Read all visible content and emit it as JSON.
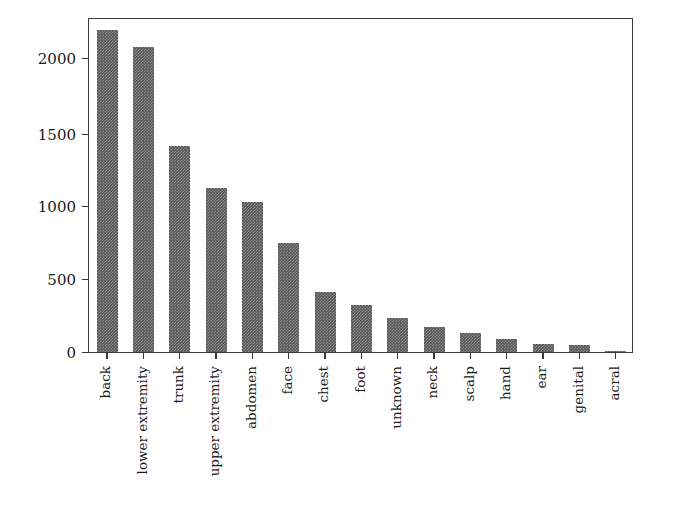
{
  "chart_data": {
    "type": "bar",
    "title": "",
    "xlabel": "",
    "ylabel": "",
    "grid": false,
    "legend": null,
    "ylim": [
      0,
      2300
    ],
    "yticks": [
      0,
      500,
      1000,
      1500,
      2000
    ],
    "ytick_labels": [
      "0",
      "500",
      "1000",
      "1500",
      "2000"
    ],
    "categories": [
      "back",
      "lower extremity",
      "trunk",
      "upper extremity",
      "abdomen",
      "face",
      "chest",
      "foot",
      "unknown",
      "neck",
      "scalp",
      "hand",
      "ear",
      "genital",
      "acral"
    ],
    "values": [
      2192,
      2077,
      1404,
      1118,
      1022,
      745,
      407,
      319,
      234,
      168,
      128,
      90,
      56,
      48,
      7
    ],
    "bar_color": "#555555",
    "bar_pattern": "hatched"
  }
}
